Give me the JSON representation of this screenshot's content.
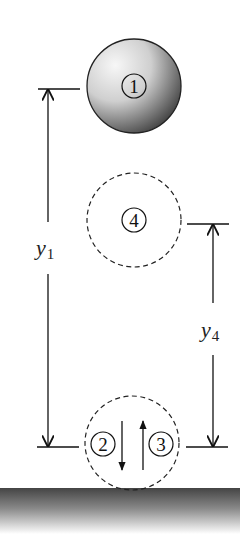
{
  "diagram": {
    "title": "",
    "positions": [
      {
        "id": "1",
        "label": "1",
        "description": "ball at initial height y1",
        "style": "solid"
      },
      {
        "id": "4",
        "label": "4",
        "description": "ball at rebound height y4",
        "style": "dashed"
      },
      {
        "id": "2",
        "label": "2",
        "description": "ball at ground moving down",
        "style": "dashed",
        "arrow": "down"
      },
      {
        "id": "3",
        "label": "3",
        "description": "ball at ground moving up",
        "style": "dashed",
        "arrow": "up"
      }
    ],
    "dimensions": [
      {
        "id": "y1",
        "symbol": "y",
        "subscript": "1"
      },
      {
        "id": "y4",
        "symbol": "y",
        "subscript": "4"
      }
    ],
    "colors": {
      "ink": "#111111",
      "ball_light": "#f4f4f4",
      "ball_dark": "#3a3a3a",
      "ground_dark": "#4a4a4a",
      "background": "#ffffff"
    }
  }
}
